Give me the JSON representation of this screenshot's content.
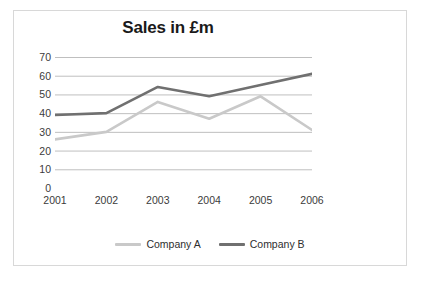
{
  "figure": {
    "title": "Sales in £m",
    "frame_color": "#d8d8d8",
    "background": "#ffffff"
  },
  "legend": {
    "position": "bottom",
    "entries": [
      {
        "label": "Company A",
        "color": "#c9c9c9",
        "swatch_name": "legend-swatch-company-a"
      },
      {
        "label": "Company B",
        "color": "#707070",
        "swatch_name": "legend-swatch-company-b"
      }
    ]
  },
  "axes": {
    "y_ticks": [
      "70",
      "60",
      "50",
      "40",
      "30",
      "20",
      "10",
      "0"
    ],
    "x_ticks": [
      "2001",
      "2002",
      "2003",
      "2004",
      "2005",
      "2006"
    ]
  },
  "chart_data": {
    "type": "line",
    "title": "Sales in £m",
    "subtitle": "",
    "xlabel": "",
    "ylabel": "",
    "categories": [
      "2001",
      "2002",
      "2003",
      "2004",
      "2005",
      "2006"
    ],
    "x": [
      2001,
      2002,
      2003,
      2004,
      2005,
      2006
    ],
    "series": [
      {
        "name": "Company A",
        "color": "#c9c9c9",
        "values": [
          26,
          30,
          46,
          37,
          49,
          31
        ]
      },
      {
        "name": "Company B",
        "color": "#707070",
        "values": [
          39,
          40,
          54,
          49,
          55,
          61
        ]
      }
    ],
    "ylim": [
      0,
      70
    ],
    "ytick_interval": 10,
    "grid": "horizontal",
    "grid_color": "#bfbfbf",
    "legend_position": "bottom",
    "markers": false,
    "annotations": []
  }
}
